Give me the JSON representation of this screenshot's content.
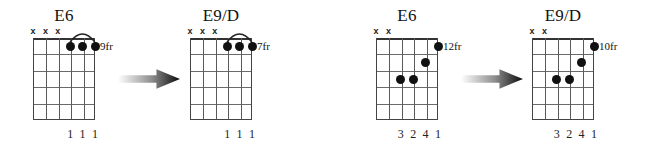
{
  "figure": {
    "kind": "guitar-chord-diagram-sequence",
    "background": "#ffffff",
    "ink": "#111111",
    "string_count": 6,
    "fret_count": 5
  },
  "diagrams": [
    {
      "id": "chord-1",
      "name": "E6",
      "fret_label": "9fr",
      "mutes": [
        "x",
        "x",
        "x"
      ],
      "mute_strings": [
        6,
        5,
        4
      ],
      "dots": [
        {
          "string": 3,
          "fret": 1
        },
        {
          "string": 2,
          "fret": 1
        },
        {
          "string": 1,
          "fret": 1
        }
      ],
      "has_slur": true,
      "fingers": [
        "1",
        "1",
        "1"
      ],
      "finger_strings": [
        3,
        2,
        1
      ]
    },
    {
      "id": "chord-2",
      "name": "E9/D",
      "fret_label": "7fr",
      "mutes": [
        "x",
        "x",
        "x"
      ],
      "mute_strings": [
        6,
        5,
        4
      ],
      "dots": [
        {
          "string": 3,
          "fret": 1
        },
        {
          "string": 2,
          "fret": 1
        },
        {
          "string": 1,
          "fret": 1
        }
      ],
      "has_slur": true,
      "fingers": [
        "1",
        "1",
        "1"
      ],
      "finger_strings": [
        3,
        2,
        1
      ]
    },
    {
      "id": "chord-3",
      "name": "E6",
      "fret_label": "12fr",
      "mutes": [
        "x",
        "x"
      ],
      "mute_strings": [
        6,
        5
      ],
      "dots": [
        {
          "string": 1,
          "fret": 1
        },
        {
          "string": 2,
          "fret": 2
        },
        {
          "string": 3,
          "fret": 3
        },
        {
          "string": 4,
          "fret": 3
        }
      ],
      "has_slur": false,
      "fingers": [
        "3",
        "2",
        "4",
        "1"
      ],
      "finger_strings": [
        4,
        3,
        2,
        1
      ]
    },
    {
      "id": "chord-4",
      "name": "E9/D",
      "fret_label": "10fr",
      "mutes": [
        "x",
        "x"
      ],
      "mute_strings": [
        6,
        5
      ],
      "dots": [
        {
          "string": 1,
          "fret": 1
        },
        {
          "string": 2,
          "fret": 2
        },
        {
          "string": 3,
          "fret": 3
        },
        {
          "string": 4,
          "fret": 3
        }
      ],
      "has_slur": false,
      "fingers": [
        "3",
        "2",
        "4",
        "1"
      ],
      "finger_strings": [
        4,
        3,
        2,
        1
      ]
    }
  ],
  "arrows": [
    {
      "id": "arrow-1",
      "direction": "right",
      "from": "chord-1",
      "to": "chord-2"
    },
    {
      "id": "arrow-2",
      "direction": "right",
      "from": "chord-3",
      "to": "chord-4"
    }
  ]
}
